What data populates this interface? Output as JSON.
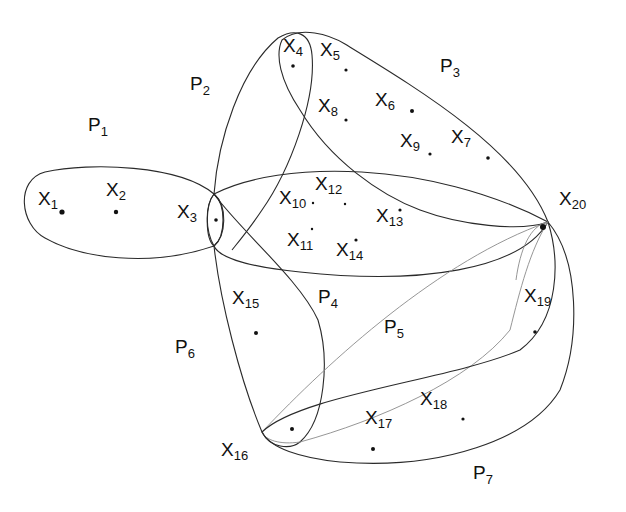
{
  "diagram": {
    "type": "hypergraph",
    "background": "#ffffff",
    "stroke_color": "#2a2a2a",
    "vertices": [
      {
        "id": "x1",
        "main": "X",
        "sub": "1",
        "label_x": 38,
        "label_y": 205,
        "dot_x": 62,
        "dot_y": 212
      },
      {
        "id": "x2",
        "main": "X",
        "sub": "2",
        "label_x": 106,
        "label_y": 196,
        "dot_x": 116,
        "dot_y": 212
      },
      {
        "id": "x3",
        "main": "X",
        "sub": "3",
        "label_x": 177,
        "label_y": 218,
        "dot_x": 216,
        "dot_y": 220
      },
      {
        "id": "x4",
        "main": "X",
        "sub": "4",
        "label_x": 283,
        "label_y": 52,
        "dot_x": 293,
        "dot_y": 66
      },
      {
        "id": "x5",
        "main": "X",
        "sub": "5",
        "label_x": 320,
        "label_y": 56,
        "dot_x": 346,
        "dot_y": 70
      },
      {
        "id": "x6",
        "main": "X",
        "sub": "6",
        "label_x": 375,
        "label_y": 106,
        "dot_x": 412,
        "dot_y": 111
      },
      {
        "id": "x7",
        "main": "X",
        "sub": "7",
        "label_x": 451,
        "label_y": 143,
        "dot_x": 488,
        "dot_y": 158
      },
      {
        "id": "x8",
        "main": "X",
        "sub": "8",
        "label_x": 318,
        "label_y": 112,
        "dot_x": 346,
        "dot_y": 120
      },
      {
        "id": "x9",
        "main": "X",
        "sub": "9",
        "label_x": 400,
        "label_y": 147,
        "dot_x": 430,
        "dot_y": 154
      },
      {
        "id": "x10",
        "main": "X",
        "sub": "10",
        "label_x": 279,
        "label_y": 204,
        "dot_x": 313,
        "dot_y": 203
      },
      {
        "id": "x11",
        "main": "X",
        "sub": "11",
        "label_x": 287,
        "label_y": 246,
        "dot_x": 312,
        "dot_y": 229
      },
      {
        "id": "x12",
        "main": "X",
        "sub": "12",
        "label_x": 315,
        "label_y": 190,
        "dot_x": 345,
        "dot_y": 204
      },
      {
        "id": "x13",
        "main": "X",
        "sub": "13",
        "label_x": 376,
        "label_y": 222,
        "dot_x": 400,
        "dot_y": 210
      },
      {
        "id": "x14",
        "main": "X",
        "sub": "14",
        "label_x": 336,
        "label_y": 256,
        "dot_x": 356,
        "dot_y": 240
      },
      {
        "id": "x15",
        "main": "X",
        "sub": "15",
        "label_x": 232,
        "label_y": 304,
        "dot_x": 256,
        "dot_y": 333
      },
      {
        "id": "x16",
        "main": "X",
        "sub": "16",
        "label_x": 221,
        "label_y": 456,
        "dot_x": 292,
        "dot_y": 429
      },
      {
        "id": "x17",
        "main": "X",
        "sub": "17",
        "label_x": 365,
        "label_y": 424,
        "dot_x": 373,
        "dot_y": 449
      },
      {
        "id": "x18",
        "main": "X",
        "sub": "18",
        "label_x": 420,
        "label_y": 405,
        "dot_x": 463,
        "dot_y": 419
      },
      {
        "id": "x19",
        "main": "X",
        "sub": "19",
        "label_x": 524,
        "label_y": 302,
        "dot_x": 535,
        "dot_y": 332
      },
      {
        "id": "x20",
        "main": "X",
        "sub": "20",
        "label_x": 559,
        "label_y": 205,
        "dot_x": 545,
        "dot_y": 226
      }
    ],
    "hyperedges": [
      {
        "id": "P1",
        "main": "P",
        "sub": "1",
        "label_x": 88,
        "label_y": 131,
        "members": [
          "x1",
          "x2",
          "x3"
        ]
      },
      {
        "id": "P2",
        "main": "P",
        "sub": "2",
        "label_x": 190,
        "label_y": 90,
        "members": [
          "x3",
          "x4"
        ]
      },
      {
        "id": "P3",
        "main": "P",
        "sub": "3",
        "label_x": 440,
        "label_y": 72,
        "members": [
          "x4",
          "x5",
          "x6",
          "x7",
          "x8",
          "x9",
          "x20"
        ]
      },
      {
        "id": "P4",
        "main": "P",
        "sub": "4",
        "label_x": 318,
        "label_y": 303,
        "members": [
          "x3",
          "x10",
          "x11",
          "x12",
          "x13",
          "x14",
          "x20"
        ]
      },
      {
        "id": "P5",
        "main": "P",
        "sub": "5",
        "label_x": 384,
        "label_y": 333,
        "members": [
          "x16",
          "x20"
        ]
      },
      {
        "id": "P6",
        "main": "P",
        "sub": "6",
        "label_x": 175,
        "label_y": 353,
        "members": [
          "x3",
          "x15",
          "x16"
        ]
      },
      {
        "id": "P7",
        "main": "P",
        "sub": "7",
        "label_x": 473,
        "label_y": 479,
        "members": [
          "x16",
          "x17",
          "x18",
          "x19",
          "x20"
        ]
      }
    ]
  }
}
